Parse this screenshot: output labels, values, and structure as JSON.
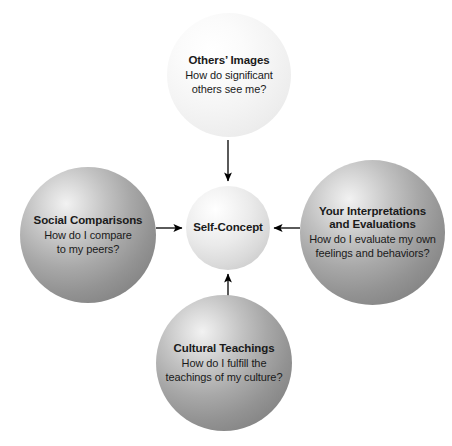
{
  "diagram": {
    "colors": {
      "background": "#ffffff",
      "text": "#1a1a1a",
      "arrow": "#000000",
      "sphere_light": "#f0f0f0",
      "sphere_grey": "#9a9a9a",
      "sphere_centre": "#dcdcdc"
    },
    "centre": {
      "label": "Self-Concept"
    },
    "nodes": [
      {
        "id": "others-images",
        "title": "Others’ Images",
        "body_line1": "How do significant",
        "body_line2": "others see me?",
        "position": "top",
        "tone": "light"
      },
      {
        "id": "social-comparisons",
        "title": "Social Comparisons",
        "body_line1": "How do I compare",
        "body_line2": "to my peers?",
        "position": "left",
        "tone": "grey"
      },
      {
        "id": "your-interpretations-and-evaluations",
        "title_line1": "Your Interpretations",
        "title_line2": "and Evaluations",
        "body_line1": "How do I evaluate my own",
        "body_line2": "feelings and behaviors?",
        "position": "right",
        "tone": "grey"
      },
      {
        "id": "cultural-teachings",
        "title": "Cultural Teachings",
        "body_line1": "How do I fulfill the",
        "body_line2": "teachings of my culture?",
        "position": "bottom",
        "tone": "grey"
      }
    ],
    "arrows": [
      {
        "id": "arrow-top-to-centre",
        "from": "others-images",
        "to": "centre",
        "direction": "down"
      },
      {
        "id": "arrow-left-to-centre",
        "from": "social-comparisons",
        "to": "centre",
        "direction": "right"
      },
      {
        "id": "arrow-right-to-centre",
        "from": "your-interpretations-and-evaluations",
        "to": "centre",
        "direction": "left"
      },
      {
        "id": "arrow-bottom-to-centre",
        "from": "cultural-teachings",
        "to": "centre",
        "direction": "up"
      }
    ]
  }
}
